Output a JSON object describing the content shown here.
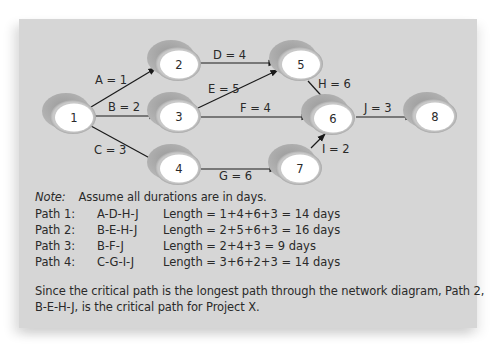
{
  "diagram": {
    "nodes": [
      {
        "id": "1",
        "label": "1"
      },
      {
        "id": "2",
        "label": "2"
      },
      {
        "id": "3",
        "label": "3"
      },
      {
        "id": "4",
        "label": "4"
      },
      {
        "id": "5",
        "label": "5"
      },
      {
        "id": "6",
        "label": "6"
      },
      {
        "id": "7",
        "label": "7"
      },
      {
        "id": "8",
        "label": "8"
      }
    ],
    "edges": [
      {
        "from": "1",
        "to": "2",
        "label": "A = 1"
      },
      {
        "from": "1",
        "to": "3",
        "label": "B = 2"
      },
      {
        "from": "1",
        "to": "4",
        "label": "C = 3"
      },
      {
        "from": "2",
        "to": "5",
        "label": "D = 4"
      },
      {
        "from": "3",
        "to": "5",
        "label": "E = 5"
      },
      {
        "from": "3",
        "to": "6",
        "label": "F = 4"
      },
      {
        "from": "4",
        "to": "7",
        "label": "G = 6"
      },
      {
        "from": "5",
        "to": "6",
        "label": "H = 6"
      },
      {
        "from": "7",
        "to": "6",
        "label": "I = 2"
      },
      {
        "from": "6",
        "to": "8",
        "label": "J = 3"
      }
    ]
  },
  "note": {
    "label": "Note:",
    "text": "Assume all durations are in days."
  },
  "paths": [
    {
      "name": "Path 1:",
      "sequence": "A-D-H-J",
      "length": "Length = 1+4+6+3 = 14 days"
    },
    {
      "name": "Path 2:",
      "sequence": "B-E-H-J",
      "length": "Length = 2+5+6+3 = 16 days"
    },
    {
      "name": "Path 3:",
      "sequence": "B-F-J",
      "length": "Length = 2+4+3 = 9 days"
    },
    {
      "name": "Path 4:",
      "sequence": "C-G-I-J",
      "length": "Length = 3+6+2+3 = 14 days"
    }
  ],
  "conclusion": {
    "line1": "Since the critical path is the longest path through the network diagram, Path 2,",
    "line2": "B-E-H-J, is the critical path for Project X."
  }
}
